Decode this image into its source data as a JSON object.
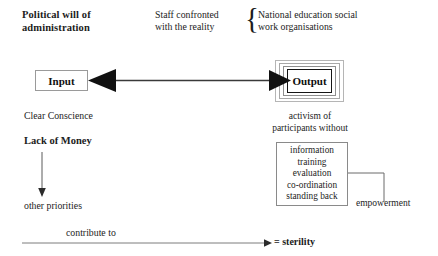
{
  "diagram": {
    "title_top_left": "Political will of\nadministration",
    "title_top_mid": "Staff confronted\nwith the reality",
    "title_top_right": "National education social\nwork organisations",
    "brace_glyph": "{",
    "input_label": "Input",
    "output_label": "Output",
    "left_notes": {
      "clear_conscience": "Clear Conscience",
      "lack_of_money": "Lack of Money",
      "other_priorities": "other priorities",
      "contribute_to": "contribute to"
    },
    "right_notes": {
      "activism": "activism of\nparticipants without",
      "empowerment": "empowerment"
    },
    "list_items": [
      "information",
      "training",
      "evaluation",
      "co-ordination",
      "standing back"
    ],
    "conclusion": "= sterility",
    "colors": {
      "ink": "#1c1c1c",
      "line": "#555555",
      "box_border_light": "#9a9a9a",
      "box_border_dark": "#151515",
      "arrow_fill": "#111111",
      "background": "#ffffff"
    }
  }
}
